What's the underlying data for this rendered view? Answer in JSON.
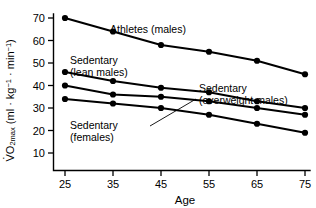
{
  "chart_data": {
    "type": "line",
    "title": "",
    "xlabel": "Age",
    "ylabel": "VO2max (ml · kg-1 · min-1)",
    "x": [
      25,
      35,
      45,
      55,
      65,
      75
    ],
    "xlim": [
      20,
      80
    ],
    "ylim": [
      10,
      73
    ],
    "xticks": [
      25,
      35,
      45,
      55,
      65,
      75
    ],
    "yticks": [
      10,
      20,
      30,
      40,
      50,
      60,
      70
    ],
    "grid": false,
    "legend": "inline-annotations",
    "series": [
      {
        "name": "Athletes (males)",
        "values": [
          70,
          64,
          58,
          55,
          51,
          45
        ]
      },
      {
        "name": "Sedentary (lean males)",
        "values": [
          46,
          42,
          39,
          37,
          33,
          30
        ]
      },
      {
        "name": "Sedentary (overweight males)",
        "values": [
          40,
          36,
          35,
          33,
          30,
          27
        ]
      },
      {
        "name": "Sedentary (females)",
        "values": [
          34,
          32,
          30,
          27,
          23,
          19
        ]
      }
    ],
    "annotations": [
      {
        "id": "athletes",
        "text_line1": "Athletes (males)",
        "text_line2": ""
      },
      {
        "id": "sedentary-lean-males",
        "text_line1": "Sedentary",
        "text_line2": "(lean males)"
      },
      {
        "id": "sedentary-overweight-males",
        "text_line1": "Sedentary",
        "text_line2": "(overweight males)"
      },
      {
        "id": "sedentary-females",
        "text_line1": "Sedentary",
        "text_line2": "(females)"
      }
    ],
    "colors": {
      "line": "#000000",
      "marker": "#000000",
      "axis": "#000000",
      "background": "#ffffff"
    }
  },
  "axis": {
    "x_title": "Age",
    "y_title_prefix": "V",
    "y_title_o": "O",
    "y_title_sub": "2max",
    "y_title_rest": " (ml · kg",
    "y_title_exp1": "−1",
    "y_title_mid": " · min",
    "y_title_exp2": "−1",
    "y_title_close": ")",
    "y_ticks": [
      "70",
      "60",
      "50",
      "40",
      "30",
      "20",
      "10"
    ],
    "x_ticks": [
      "25",
      "35",
      "45",
      "55",
      "65",
      "75"
    ]
  },
  "labels": {
    "athletes": "Athletes (males)",
    "sed_lean_1": "Sedentary",
    "sed_lean_2": "(lean males)",
    "sed_over_1": "Sedentary",
    "sed_over_2": "(overweight males)",
    "sed_fem_1": "Sedentary",
    "sed_fem_2": "(females)"
  }
}
